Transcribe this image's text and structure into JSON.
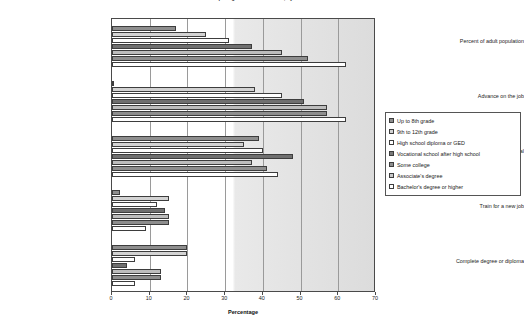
{
  "chart_data": {
    "type": "bar",
    "orientation": "horizontal",
    "title": "Reasons for Participating in Adult Education, by Educational Attainment",
    "xlabel": "Percentage",
    "ylabel": "",
    "xlim": [
      0,
      70
    ],
    "xticks": [
      0,
      10,
      20,
      30,
      40,
      50,
      60,
      70
    ],
    "grid": true,
    "legend_position": "right",
    "categories": [
      "Percent of adult population",
      "Advance on the job",
      "Personal/social",
      "Train for a new job",
      "Complete degree or diploma"
    ],
    "series": [
      {
        "name": "Up to 8th grade",
        "color": "#8e8e8e",
        "values": [
          17,
          0,
          39,
          2,
          20
        ]
      },
      {
        "name": "9th to 12th grade",
        "color": "#d3d3d3",
        "values": [
          25,
          38,
          35,
          15,
          20
        ]
      },
      {
        "name": "High school diploma or GED",
        "color": "#fefefe",
        "values": [
          31,
          45,
          40,
          12,
          6
        ]
      },
      {
        "name": "Vocational school after high school",
        "color": "#6f6f6f",
        "values": [
          37,
          51,
          48,
          14,
          4
        ]
      },
      {
        "name": "Some college",
        "color": "#bdbdbd",
        "values": [
          45,
          57,
          37,
          15,
          13
        ]
      },
      {
        "name": "Associate's degree",
        "color": "#8e8e8e",
        "values": [
          52,
          57,
          41,
          15,
          13
        ]
      },
      {
        "name": "Bachelor's degree or higher",
        "color": "#ffffff",
        "values": [
          62,
          62,
          44,
          9,
          6
        ]
      }
    ]
  },
  "legend": {
    "items": [
      {
        "label": "Up to 8th grade",
        "swatch": "#8e8e8e"
      },
      {
        "label": "9th to 12th grade",
        "swatch": "#d3d3d3"
      },
      {
        "label": "High school diploma or GED",
        "swatch": "#ffffff"
      },
      {
        "label": "Vocational school after high school",
        "swatch": "#7a7a7a"
      },
      {
        "label": "Some college",
        "swatch": "#8e8e8e"
      },
      {
        "label": "Associate's degree",
        "swatch": "#c9c9c9"
      },
      {
        "label": "Bachelor's degree or higher",
        "swatch": "#ffffff"
      }
    ]
  }
}
